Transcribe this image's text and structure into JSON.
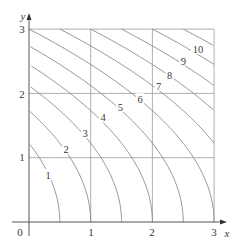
{
  "chart_data": {
    "type": "contour",
    "title": "",
    "xlabel": "x",
    "ylabel": "y",
    "xlim": [
      0,
      3
    ],
    "ylim": [
      0,
      3
    ],
    "grid": true,
    "x_ticks": [
      "0",
      "1",
      "2",
      "3"
    ],
    "y_ticks": [
      "1",
      "2",
      "3"
    ],
    "origin_label": "0",
    "function_estimate": "f(x,y) = 2x + (2/3)y^2",
    "levels": [
      1,
      2,
      3,
      4,
      5,
      6,
      7,
      8,
      9,
      10,
      11,
      12
    ],
    "level_labels": [
      {
        "text": "1",
        "x": 0.31,
        "y": 0.73
      },
      {
        "text": "2",
        "x": 0.6,
        "y": 1.13
      },
      {
        "text": "3",
        "x": 0.91,
        "y": 1.38
      },
      {
        "text": "4",
        "x": 1.2,
        "y": 1.63
      },
      {
        "text": "5",
        "x": 1.48,
        "y": 1.79
      },
      {
        "text": "6",
        "x": 1.8,
        "y": 1.91
      },
      {
        "text": "7",
        "x": 2.1,
        "y": 2.12
      },
      {
        "text": "8",
        "x": 2.28,
        "y": 2.29
      },
      {
        "text": "9",
        "x": 2.5,
        "y": 2.51
      },
      {
        "text": "10",
        "x": 2.74,
        "y": 2.69
      }
    ]
  },
  "colors": {
    "curve": "#8a8a8a",
    "grid": "#9a9a9a",
    "axis": "#555555",
    "text": "#3a3a3a"
  }
}
